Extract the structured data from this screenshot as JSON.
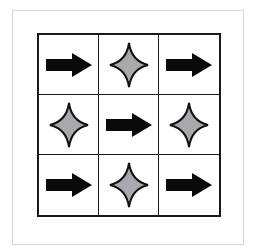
{
  "puzzle": {
    "grid": [
      [
        "arrow-right",
        "star4",
        "arrow-right"
      ],
      [
        "star4",
        "arrow-right",
        "star4"
      ],
      [
        "arrow-right",
        "star4",
        "arrow-right"
      ]
    ],
    "colors": {
      "arrow": "#0a0a0a",
      "star_fill": "#a9a9ad",
      "star_stroke": "#111111",
      "grid_line": "#1a1a1a",
      "frame": "#d6d6d6"
    }
  }
}
